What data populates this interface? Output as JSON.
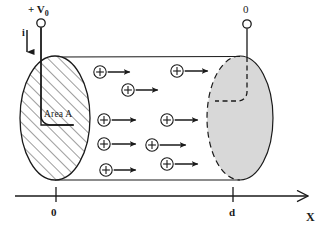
{
  "figure": {
    "type": "physics-diagram"
  },
  "labels": {
    "left_terminal": "+ V",
    "left_terminal_sub": "0",
    "current_symbol": "i",
    "right_terminal": "0",
    "area_label": "Area A",
    "axis_origin": "0",
    "axis_distance": "d",
    "axis_name": "X"
  },
  "colors": {
    "ink": "#1a1a1a",
    "hatch": "#4a4a4a",
    "right_face_fill": "#d8d8d8",
    "background": "#ffffff"
  },
  "geometry": {
    "cylinder": {
      "top_y": 57,
      "bottom_y": 180,
      "left_x": 55,
      "right_x": 240
    },
    "left_face": {
      "cx": 55,
      "cy": 118,
      "rx": 35,
      "ry": 62,
      "style": "hatched"
    },
    "right_face": {
      "cx": 240,
      "cy": 118,
      "rx": 33,
      "ry": 62,
      "style": "shaded-dashed"
    },
    "left_wire": {
      "circle_cx": 41,
      "circle_cy": 23,
      "circle_r": 4
    },
    "right_wire": {
      "circle_cx": 247,
      "circle_cy": 24,
      "circle_r": 4
    },
    "axis": {
      "y": 196,
      "x_start": 15,
      "x_end": 310,
      "tick_origin_x": 56,
      "tick_d_x": 233
    }
  },
  "charges": [
    {
      "cx": 100,
      "cy": 72,
      "arrow_len": 22
    },
    {
      "cx": 128,
      "cy": 90,
      "arrow_len": 22
    },
    {
      "cx": 177,
      "cy": 71,
      "arrow_len": 23
    },
    {
      "cx": 104,
      "cy": 120,
      "arrow_len": 24
    },
    {
      "cx": 167,
      "cy": 120,
      "arrow_len": 23
    },
    {
      "cx": 104,
      "cy": 144,
      "arrow_len": 24
    },
    {
      "cx": 152,
      "cy": 145,
      "arrow_len": 26
    },
    {
      "cx": 167,
      "cy": 164,
      "arrow_len": 23
    },
    {
      "cx": 106,
      "cy": 170,
      "arrow_len": 22
    }
  ]
}
